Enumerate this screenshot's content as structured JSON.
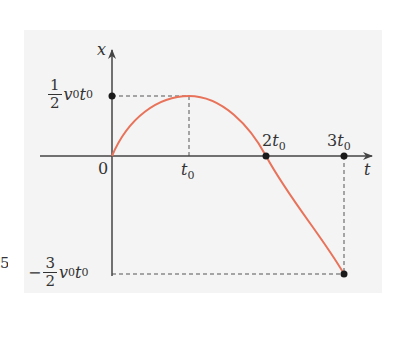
{
  "figure": {
    "axes": {
      "y_label": "x",
      "x_label": "t",
      "origin_label": "0"
    },
    "x_ticks": [
      {
        "coef": "",
        "var": "t",
        "sub": "0",
        "full": "t0"
      },
      {
        "coef": "2",
        "var": "t",
        "sub": "0",
        "full": "2t0"
      },
      {
        "coef": "3",
        "var": "t",
        "sub": "0",
        "full": "3t0"
      }
    ],
    "y_ticks": [
      {
        "sign": "",
        "num": "1",
        "den": "2",
        "v": "v",
        "vsub": "0",
        "t": "t",
        "tsub": "0",
        "full": "1/2 v0 t0"
      },
      {
        "sign": "−",
        "num": "3",
        "den": "2",
        "v": "v",
        "vsub": "0",
        "t": "t",
        "tsub": "0",
        "full": "-3/2 v0 t0"
      }
    ],
    "edge_fragment": "5",
    "colors": {
      "curve": "#e8735a",
      "axis": "#444444",
      "dashed": "#555555",
      "panel": "#f4f4f4",
      "point": "#1a1a1a"
    },
    "curve_description": "x(t) = v0 t - v0 t^2 / (2 t0); rises from 0 to max 1/2 v0 t0 at t0, crosses zero at 2t0, reaches -3/2 v0 t0 at 3t0"
  }
}
